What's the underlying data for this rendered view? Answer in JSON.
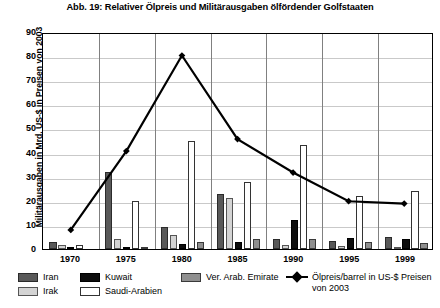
{
  "chart_data": {
    "type": "bar",
    "title": "Abb. 19: Relativer Ölpreis und Militärausgaben ölfördender Golfstaaten",
    "xlabel": "",
    "ylabel": "Militärausgaben in Mrd. US-$ in Preisen von 2003",
    "ylim": [
      0,
      90
    ],
    "ytick_step": 10,
    "yticks": [
      "0",
      "10",
      "20",
      "30",
      "40",
      "50",
      "60",
      "70",
      "80",
      "90"
    ],
    "grid": true,
    "legend_position": "bottom",
    "categories": [
      "1970",
      "1975",
      "1980",
      "1985",
      "1990",
      "1995",
      "1999"
    ],
    "series": [
      {
        "name": "Iran",
        "key": "iran",
        "color": "#595959",
        "values": [
          3.0,
          32.0,
          9.0,
          23.0,
          4.0,
          3.5,
          5.0
        ]
      },
      {
        "name": "Irak",
        "key": "irak",
        "color": "#d4d4d4",
        "values": [
          1.8,
          4.0,
          6.0,
          21.0,
          1.5,
          1.2,
          1.0
        ]
      },
      {
        "name": "Kuwait",
        "key": "kuwait",
        "color": "#0d0d0d",
        "values": [
          0.5,
          1.0,
          2.0,
          3.0,
          12.0,
          4.5,
          4.0
        ]
      },
      {
        "name": "Saudi-Arabien",
        "key": "saudi",
        "color": "#ffffff",
        "values": [
          1.5,
          20.0,
          45.0,
          28.0,
          43.0,
          22.0,
          24.0
        ]
      },
      {
        "name": "Ver. Arab. Emirate",
        "key": "uae",
        "color": "#8f8f8f",
        "values": [
          0.0,
          0.3,
          3.0,
          4.0,
          4.0,
          3.0,
          2.5
        ]
      }
    ],
    "line_series": {
      "name": "Ölpreis/barrel in US-$ Preisen von 2003",
      "name_line1": "Ölpreis/barrel in US-$ Preisen",
      "name_line2": "von 2003",
      "color": "#000000",
      "marker": "diamond",
      "values": [
        8,
        41,
        81,
        46,
        32,
        20,
        19
      ]
    }
  },
  "legend": {
    "items": [
      {
        "label": "Iran",
        "swatch": "iran-swatch"
      },
      {
        "label": "Irak",
        "swatch": "irak-swatch"
      },
      {
        "label": "Kuwait",
        "swatch": "kuwait-swatch"
      },
      {
        "label": "Saudi-Arabien",
        "swatch": "saudi-arabien-swatch"
      },
      {
        "label": "Ver. Arab. Emirate",
        "swatch": "uae-swatch"
      }
    ],
    "line_label_1": "Ölpreis/barrel in US-$ Preisen",
    "line_label_2": "von 2003"
  }
}
